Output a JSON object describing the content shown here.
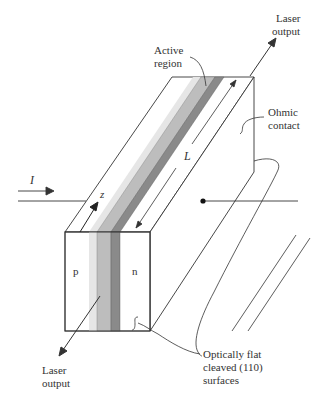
{
  "figure": {
    "type": "semiconductor laser diode schematic",
    "labels": {
      "laser_output_top": [
        "Laser",
        "output"
      ],
      "active_region": [
        "Active",
        "region"
      ],
      "ohmic_contact": [
        "Ohmic",
        "contact"
      ],
      "length": "L",
      "current": "I",
      "axis_z": "z",
      "p_region": "p",
      "n_region": "n",
      "laser_output_bottom": [
        "Laser",
        "output"
      ],
      "cleaved_surfaces": [
        "Optically flat",
        "cleaved (110)",
        "surfaces"
      ]
    },
    "colors": {
      "outline": "#333333",
      "layer_light": "#e6e6e6",
      "layer_mid": "#bdbdbd",
      "layer_dark": "#8a8a8a",
      "background": "#ffffff"
    }
  }
}
